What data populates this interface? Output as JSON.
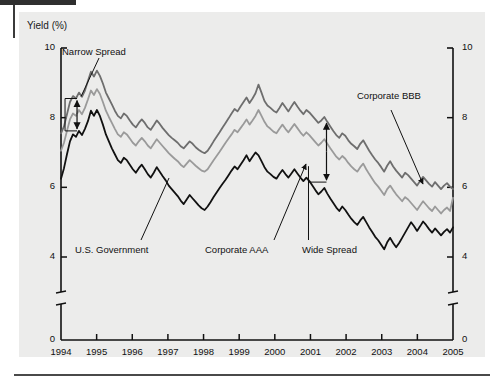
{
  "figure": {
    "y_axis_title": "Yield (%)",
    "background_color": "#ececeb",
    "page_color": "#ffffff"
  },
  "annotations": [
    {
      "id": "narrow-spread",
      "label": "Narrow Spread"
    },
    {
      "id": "corporate-bbb",
      "label": "Corporate BBB"
    },
    {
      "id": "us-government",
      "label": "U.S. Government"
    },
    {
      "id": "corporate-aaa",
      "label": "Corporate AAA"
    },
    {
      "id": "wide-spread",
      "label": "Wide Spread"
    }
  ],
  "chart_data": {
    "type": "line",
    "title": "",
    "subtitle": "",
    "xlabel": "",
    "ylabel": "Yield (%)",
    "ylim": [
      0,
      10
    ],
    "xlim": [
      1994,
      2005
    ],
    "grid": false,
    "legend_position": "inline-annotations",
    "axis_break": {
      "present": true,
      "between": [
        0,
        4
      ],
      "symbol": "double-slash"
    },
    "y_ticks": [
      0,
      4,
      6,
      8,
      10
    ],
    "y_ticks_right": [
      0,
      4,
      6,
      8,
      10
    ],
    "x_ticks": [
      1994,
      1995,
      1996,
      1997,
      1998,
      1999,
      2000,
      2001,
      2002,
      2003,
      2004,
      2005
    ],
    "x_tick_labels": [
      "1994",
      "1995",
      "1996",
      "1997",
      "1998",
      "1999",
      "2000",
      "2001",
      "2002",
      "2003",
      "2004",
      "2005"
    ],
    "series": [
      {
        "name": "Corporate BBB",
        "color": "#6e6e6e",
        "width": 1.8,
        "values": [
          7.55,
          7.75,
          8.1,
          8.45,
          8.62,
          8.55,
          8.72,
          8.6,
          8.78,
          9.05,
          9.32,
          9.18,
          9.35,
          9.2,
          8.98,
          8.72,
          8.55,
          8.38,
          8.2,
          8.05,
          7.98,
          8.12,
          8.05,
          7.92,
          7.8,
          7.72,
          7.85,
          7.95,
          7.85,
          7.72,
          7.65,
          7.78,
          7.92,
          7.82,
          7.7,
          7.6,
          7.5,
          7.42,
          7.35,
          7.28,
          7.18,
          7.12,
          7.22,
          7.32,
          7.25,
          7.15,
          7.08,
          7.02,
          6.98,
          7.05,
          7.18,
          7.32,
          7.45,
          7.58,
          7.72,
          7.85,
          7.98,
          8.12,
          8.25,
          8.18,
          8.32,
          8.45,
          8.58,
          8.42,
          8.55,
          8.7,
          8.95,
          8.72,
          8.48,
          8.35,
          8.28,
          8.2,
          8.15,
          8.28,
          8.42,
          8.3,
          8.18,
          8.32,
          8.45,
          8.32,
          8.2,
          8.1,
          8.22,
          8.15,
          8.05,
          7.95,
          7.85,
          7.92,
          8.02,
          7.88,
          7.75,
          7.62,
          7.5,
          7.42,
          7.55,
          7.48,
          7.35,
          7.25,
          7.18,
          7.1,
          7.25,
          7.35,
          7.2,
          7.05,
          6.92,
          6.8,
          6.7,
          6.58,
          6.45,
          6.62,
          6.75,
          6.6,
          6.48,
          6.38,
          6.28,
          6.42,
          6.35,
          6.25,
          6.15,
          6.05,
          6.18,
          6.3,
          6.2,
          6.1,
          6.02,
          6.15,
          6.05,
          5.95,
          6.05,
          6.12,
          6.02,
          5.95
        ]
      },
      {
        "name": "Corporate AAA",
        "color": "#9a9a9a",
        "width": 1.8,
        "values": [
          7.05,
          7.28,
          7.62,
          7.95,
          8.12,
          8.05,
          8.22,
          8.1,
          8.28,
          8.52,
          8.78,
          8.65,
          8.82,
          8.68,
          8.45,
          8.2,
          8.02,
          7.85,
          7.68,
          7.52,
          7.45,
          7.58,
          7.52,
          7.4,
          7.28,
          7.2,
          7.32,
          7.42,
          7.32,
          7.2,
          7.12,
          7.25,
          7.38,
          7.28,
          7.18,
          7.08,
          6.98,
          6.9,
          6.82,
          6.75,
          6.65,
          6.58,
          6.68,
          6.78,
          6.7,
          6.62,
          6.55,
          6.48,
          6.45,
          6.52,
          6.65,
          6.78,
          6.9,
          7.02,
          7.15,
          7.28,
          7.4,
          7.52,
          7.65,
          7.58,
          7.7,
          7.82,
          7.95,
          7.8,
          7.92,
          8.05,
          8.22,
          8.05,
          7.88,
          7.75,
          7.68,
          7.6,
          7.55,
          7.68,
          7.8,
          7.68,
          7.58,
          7.7,
          7.82,
          7.7,
          7.58,
          7.48,
          7.58,
          7.5,
          7.4,
          7.3,
          7.2,
          7.28,
          7.38,
          7.25,
          7.12,
          7.0,
          6.88,
          6.8,
          6.9,
          6.82,
          6.7,
          6.6,
          6.52,
          6.45,
          6.58,
          6.68,
          6.52,
          6.38,
          6.25,
          6.12,
          6.02,
          5.9,
          5.78,
          5.95,
          6.05,
          5.92,
          5.8,
          5.7,
          5.6,
          5.72,
          5.65,
          5.55,
          5.45,
          5.35,
          5.48,
          5.6,
          5.5,
          5.4,
          5.32,
          5.45,
          5.35,
          5.25,
          5.35,
          5.42,
          5.32,
          5.7
        ]
      },
      {
        "name": "U.S. Government",
        "color": "#111111",
        "width": 1.8,
        "values": [
          6.25,
          6.55,
          6.95,
          7.32,
          7.52,
          7.45,
          7.62,
          7.5,
          7.68,
          7.9,
          8.2,
          8.05,
          8.22,
          8.05,
          7.8,
          7.52,
          7.32,
          7.12,
          6.95,
          6.78,
          6.7,
          6.85,
          6.78,
          6.65,
          6.52,
          6.42,
          6.55,
          6.65,
          6.52,
          6.38,
          6.28,
          6.42,
          6.58,
          6.45,
          6.32,
          6.2,
          6.05,
          5.95,
          5.85,
          5.75,
          5.62,
          5.52,
          5.65,
          5.78,
          5.68,
          5.58,
          5.48,
          5.4,
          5.35,
          5.45,
          5.58,
          5.72,
          5.85,
          5.98,
          6.1,
          6.22,
          6.35,
          6.48,
          6.6,
          6.52,
          6.65,
          6.78,
          6.92,
          6.75,
          6.88,
          7.0,
          6.92,
          6.75,
          6.58,
          6.45,
          6.38,
          6.3,
          6.25,
          6.38,
          6.5,
          6.38,
          6.28,
          6.4,
          6.52,
          6.4,
          6.28,
          6.18,
          6.28,
          6.18,
          6.05,
          5.92,
          5.8,
          5.88,
          5.98,
          5.82,
          5.68,
          5.55,
          5.42,
          5.32,
          5.45,
          5.35,
          5.22,
          5.1,
          5.0,
          4.92,
          5.05,
          5.15,
          5.0,
          4.85,
          4.72,
          4.58,
          4.48,
          4.35,
          4.22,
          4.42,
          4.55,
          4.4,
          4.28,
          4.4,
          4.55,
          4.7,
          4.85,
          5.0,
          4.88,
          4.75,
          4.88,
          5.02,
          4.92,
          4.8,
          4.7,
          4.82,
          4.72,
          4.62,
          4.72,
          4.8,
          4.7,
          4.85
        ]
      }
    ],
    "spread_markers": [
      {
        "id": "narrow-spread",
        "x_year": 1994.45,
        "y_top": 8.55,
        "y_bottom": 7.62,
        "label": "Narrow Spread"
      },
      {
        "id": "wide-spread",
        "x_year": 2001.45,
        "y_top": 7.9,
        "y_bottom": 6.15,
        "label": "Wide Spread"
      }
    ]
  }
}
